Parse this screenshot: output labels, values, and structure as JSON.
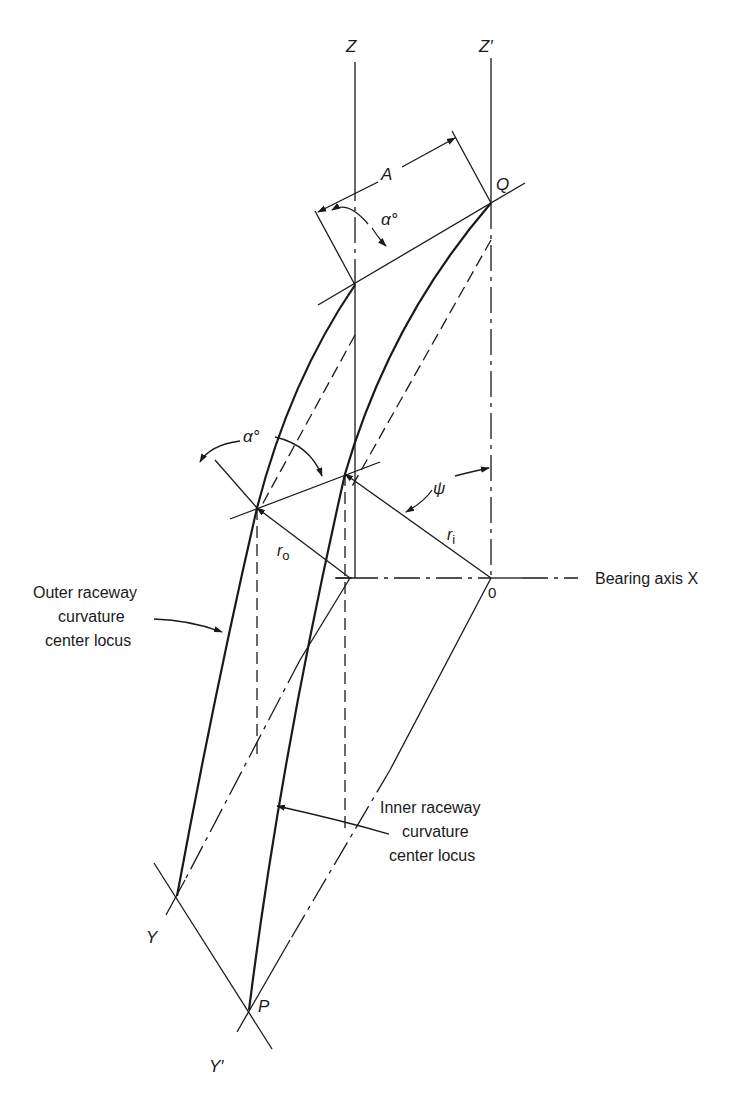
{
  "figure": {
    "type": "bearing raceway curvature center geometry",
    "axes": {
      "z": "Z",
      "z_prime": "Z′",
      "y": "Y",
      "y_prime": "Y′",
      "bearing_axis": "Bearing axis X",
      "origin": "0"
    },
    "points": {
      "q": "Q",
      "p": "P"
    },
    "dimensions": {
      "a": "A",
      "alpha_top": "α°",
      "alpha_mid": "α°",
      "psi": "ψ",
      "r_outer": "r",
      "r_outer_sub": "o",
      "r_inner": "r",
      "r_inner_sub": "i"
    },
    "callouts": {
      "outer": [
        "Outer raceway",
        "curvature",
        "center locus"
      ],
      "inner": [
        "Inner raceway",
        "curvature",
        "center locus"
      ]
    }
  }
}
